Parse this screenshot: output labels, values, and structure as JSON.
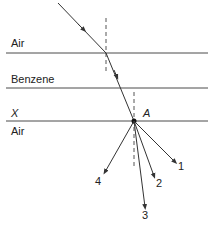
{
  "diagram": {
    "type": "refraction-diagram",
    "media_labels": {
      "top": "Air",
      "middle": "Benzene",
      "surface": "X",
      "bottom": "Air"
    },
    "point_label": "A",
    "ray_labels": [
      "1",
      "2",
      "3",
      "4"
    ],
    "colors": {
      "line": "#4a4a4a",
      "ray": "#333333",
      "normal": "#555555",
      "text": "#222222"
    }
  }
}
